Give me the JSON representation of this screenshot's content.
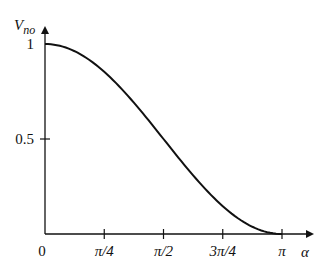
{
  "chart_data": {
    "type": "line",
    "title": "",
    "xlabel": "α",
    "ylabel": "V_no",
    "ylabel_main": "V",
    "ylabel_sub": "no",
    "x_ticks": [
      "0",
      "π/4",
      "π/2",
      "3π/4",
      "π"
    ],
    "x_tick_values": [
      0,
      0.7854,
      1.5708,
      2.3562,
      3.1416
    ],
    "y_ticks": [
      "0.5",
      "1"
    ],
    "y_tick_values": [
      0.5,
      1
    ],
    "xlim": [
      0,
      3.1416
    ],
    "ylim": [
      0,
      1
    ],
    "grid": false,
    "series": [
      {
        "name": "V_no",
        "x": [
          0,
          0.3927,
          0.7854,
          1.1781,
          1.5708,
          1.9635,
          2.3562,
          2.7489,
          3.1416
        ],
        "values": [
          1.0,
          0.962,
          0.854,
          0.691,
          0.5,
          0.309,
          0.146,
          0.038,
          0.0
        ]
      }
    ]
  }
}
